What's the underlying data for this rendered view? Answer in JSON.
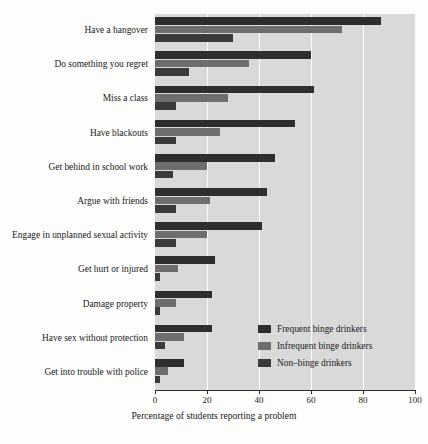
{
  "chart_data": {
    "type": "bar",
    "orientation": "horizontal",
    "title": "",
    "xlabel": "Percentage of students reporting a problem",
    "ylabel": "",
    "xlim": [
      0,
      100
    ],
    "xticks": [
      0,
      20,
      40,
      60,
      80,
      100
    ],
    "xticklabels": [
      "0",
      "20",
      "40",
      "60",
      "80",
      "100"
    ],
    "grid": "vertical",
    "legend_position": "center-right-inside",
    "categories": [
      "Have a hangover",
      "Do something you regret",
      "Miss a class",
      "Have blackouts",
      "Get behind in school work",
      "Argue with friends",
      "Engage in unplanned sexual activity",
      "Get hurt or injured",
      "Damage property",
      "Have sex without protection",
      "Get into trouble with police"
    ],
    "series": [
      {
        "name": "Frequent binge drinkers",
        "color": "#2e2e2e",
        "values": [
          87,
          60,
          61,
          54,
          46,
          43,
          41,
          23,
          22,
          22,
          11
        ]
      },
      {
        "name": "Infrequent binge drinkers",
        "color": "#6e6e6e",
        "values": [
          72,
          36,
          28,
          25,
          20,
          21,
          20,
          9,
          8,
          11,
          5
        ]
      },
      {
        "name": "Non–binge drinkers",
        "color": "#3a3a3a",
        "values": [
          30,
          13,
          8,
          8,
          7,
          8,
          8,
          2,
          2,
          4,
          2
        ]
      }
    ],
    "plot_background": "#d9d9d9",
    "gridline_color": "#fbfbfb",
    "page_background": "#fdfdfb"
  }
}
